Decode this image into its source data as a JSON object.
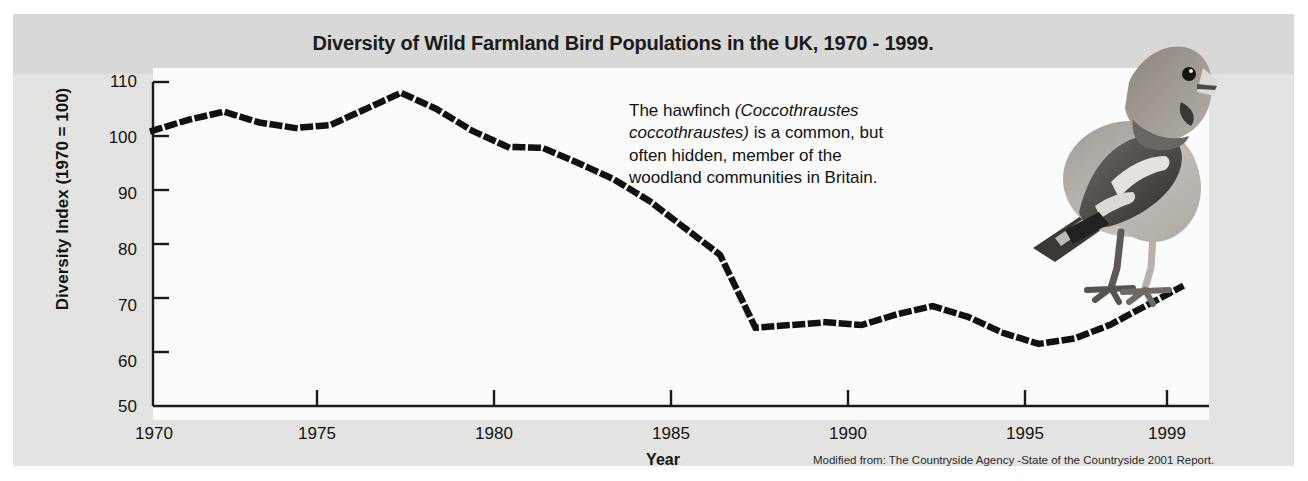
{
  "figure": {
    "title": "Diversity of Wild Farmland Bird Populations in the UK, 1970 - 1999.",
    "source_note": "Modified from: The Countryside Agency -State of the Countryside 2001 Report.",
    "annotation": {
      "line1_pre": "The hawfinch ",
      "line1_sci": "(Coccothraustes",
      "line2_sci": "coccothraustes)",
      "line2_post": " is a common, but",
      "line3": "often hidden, member of the",
      "line4": "woodland communities in Britain."
    },
    "photo_caption": "hawfinch-photograph",
    "colors": {
      "panel_background": "#e3e3e1",
      "title_band": "#d8d8d6",
      "plot_background": "#fbfbfb",
      "axis": "#1a1a1a",
      "series": "#111111",
      "text": "#141414"
    }
  },
  "chart_data": {
    "type": "line",
    "title": "Diversity of Wild Farmland Bird Populations in the UK, 1970 - 1999.",
    "xlabel": "Year",
    "ylabel": "Diversity Index (1970 = 100)",
    "xlim": [
      1970,
      1999.8
    ],
    "ylim": [
      50,
      110
    ],
    "xticks": [
      1970,
      1975,
      1980,
      1985,
      1990,
      1995,
      1999
    ],
    "xticklabels": [
      "1970",
      "1975",
      "1980",
      "1985",
      "1990",
      "1995",
      "1999"
    ],
    "yticks": [
      50,
      60,
      70,
      80,
      90,
      100,
      110
    ],
    "yticklabels": [
      "50",
      "60",
      "70",
      "80",
      "90",
      "100",
      "110"
    ],
    "grid": false,
    "legend": null,
    "line_style": "dotted",
    "series": [
      {
        "name": "Diversity Index",
        "x": [
          1970,
          1971,
          1972,
          1973,
          1974,
          1975,
          1976,
          1977,
          1978,
          1979,
          1980,
          1981,
          1982,
          1983,
          1984,
          1985,
          1986,
          1987,
          1988,
          1989,
          1990,
          1991,
          1992,
          1993,
          1994,
          1995,
          1996,
          1997,
          1998,
          1999
        ],
        "values": [
          101,
          103,
          104.5,
          102.5,
          101.5,
          102,
          105,
          108,
          105,
          101,
          98,
          97.8,
          95,
          92,
          88,
          83,
          78,
          64.5,
          65,
          65.5,
          65,
          67,
          68.5,
          66.5,
          63.5,
          61.5,
          62.5,
          65,
          68.5,
          72
        ]
      }
    ]
  }
}
